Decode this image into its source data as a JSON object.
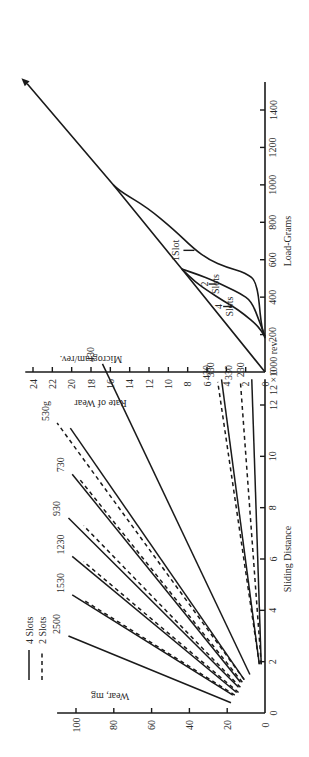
{
  "chart_data": [
    {
      "type": "line",
      "title": "",
      "xlabel": "Sliding Distance",
      "x_unit_label": "12 ×1000 rev.",
      "ylabel": "Wear, mg",
      "xlim": [
        0,
        13
      ],
      "ylim": [
        0,
        110
      ],
      "x_ticks": [
        0,
        2,
        4,
        6,
        8,
        10,
        12
      ],
      "y_ticks": [
        0,
        20,
        40,
        60,
        80,
        100
      ],
      "legend": {
        "placement": "top-left",
        "entries": [
          {
            "label": "4 Slots",
            "style": "solid"
          },
          {
            "label": "2 Slots",
            "style": "dashed"
          }
        ]
      },
      "series": [
        {
          "name": "2500",
          "group": "4 Slots",
          "style": "solid",
          "label": "2500",
          "points": [
            [
              0.4,
              18
            ],
            [
              3.0,
              104
            ]
          ]
        },
        {
          "name": "1530 (4 slots)",
          "group": "4 Slots",
          "style": "solid",
          "label": "1530",
          "points": [
            [
              0.7,
              17
            ],
            [
              4.6,
              102
            ]
          ]
        },
        {
          "name": "1530 (2 slots)",
          "group": "2 Slots",
          "style": "dashed",
          "label": "",
          "points": [
            [
              0.7,
              16
            ],
            [
              4.4,
              96
            ]
          ]
        },
        {
          "name": "1230 (4 slots)",
          "group": "4 Slots",
          "style": "solid",
          "label": "1230",
          "points": [
            [
              0.8,
              15
            ],
            [
              6.1,
              102
            ]
          ]
        },
        {
          "name": "1230 (2 slots)",
          "group": "2 Slots",
          "style": "dashed",
          "label": "",
          "points": [
            [
              0.8,
              14
            ],
            [
              5.9,
              96
            ]
          ]
        },
        {
          "name": "930 (4 slots)",
          "group": "4 Slots",
          "style": "solid",
          "label": "930",
          "points": [
            [
              1.0,
              14
            ],
            [
              7.6,
              104
            ]
          ]
        },
        {
          "name": "930 (2 slots)",
          "group": "2 Slots",
          "style": "dashed",
          "label": "",
          "points": [
            [
              1.0,
              13
            ],
            [
              7.3,
              96
            ]
          ]
        },
        {
          "name": "730 (4 slots)",
          "group": "4 Slots",
          "style": "solid",
          "label": "730",
          "points": [
            [
              1.2,
              13
            ],
            [
              9.3,
              102
            ]
          ]
        },
        {
          "name": "730 (2 slots)",
          "group": "2 Slots",
          "style": "dashed",
          "label": "",
          "points": [
            [
              1.2,
              12
            ],
            [
              9.1,
              98
            ]
          ]
        },
        {
          "name": "530g (2 slots)",
          "group": "2 Slots",
          "style": "dashed",
          "label": "530g",
          "points": [
            [
              1.3,
              11
            ],
            [
              11.3,
              110
            ]
          ]
        },
        {
          "name": "530 (4 slots)",
          "group": "4 Slots",
          "style": "solid",
          "label": "",
          "points": [
            [
              1.3,
              11
            ],
            [
              11.1,
              103
            ]
          ]
        },
        {
          "name": "430 (4 slots, upper)",
          "group": "4 Slots",
          "style": "solid",
          "label": "430",
          "points": [
            [
              1.5,
              8
            ],
            [
              13.6,
              86
            ]
          ]
        },
        {
          "name": "430 (2 slots)",
          "group": "2 Slots",
          "style": "dashed",
          "label": "430",
          "points": [
            [
              1.9,
              3
            ],
            [
              12.9,
              25
            ]
          ]
        },
        {
          "name": "330 (4 slots)",
          "group": "4 Slots",
          "style": "solid",
          "label": "330",
          "points": [
            [
              1.9,
              3
            ],
            [
              13.0,
              23
            ]
          ]
        },
        {
          "name": "330 (2 slots)",
          "group": "2 Slots",
          "style": "dashed",
          "label": "330",
          "points": [
            [
              1.9,
              2
            ],
            [
              12.9,
              13
            ]
          ]
        },
        {
          "name": "230 (4 slots)",
          "group": "4 Slots",
          "style": "solid",
          "label": "230",
          "points": [
            [
              1.9,
              2
            ],
            [
              13.0,
              7
            ]
          ]
        }
      ]
    },
    {
      "type": "line",
      "title": "",
      "xlabel": "Load-Grams",
      "ylabel": "Rate of Wear",
      "ylabel_unit": "Microgram/rev.",
      "xlim": [
        0,
        1550
      ],
      "ylim": [
        0,
        25
      ],
      "x_ticks": [
        0,
        200,
        400,
        600,
        800,
        1000,
        1200,
        1400
      ],
      "y_ticks": [
        0,
        2,
        4,
        6,
        8,
        10,
        12,
        14,
        16,
        18,
        20,
        22,
        24
      ],
      "arrow_at_end": true,
      "series": [
        {
          "name": "Reference line (no slots)",
          "label": "",
          "points": [
            [
              0,
              0
            ],
            [
              550,
              8.6
            ],
            [
              1000,
              15.7
            ],
            [
              1540,
              24.6
            ]
          ]
        },
        {
          "name": "1 Slot",
          "label": "1Slot",
          "points": [
            [
              180,
              0
            ],
            [
              250,
              0.4
            ],
            [
              480,
              0.8
            ],
            [
              530,
              2
            ],
            [
              560,
              4
            ],
            [
              600,
              5.8
            ],
            [
              660,
              7.4
            ],
            [
              760,
              9.4
            ],
            [
              880,
              12.2
            ],
            [
              960,
              14.8
            ],
            [
              1000,
              15.7
            ]
          ]
        },
        {
          "name": "2 Slots",
          "label": "2 Slots",
          "points": [
            [
              190,
              0
            ],
            [
              260,
              0.5
            ],
            [
              380,
              1.4
            ],
            [
              420,
              2.6
            ],
            [
              450,
              3.8
            ],
            [
              490,
              5.4
            ],
            [
              520,
              6.9
            ],
            [
              550,
              8.6
            ]
          ]
        },
        {
          "name": "4 Slots",
          "label": "4 Slots",
          "points": [
            [
              190,
              0
            ],
            [
              250,
              0.8
            ],
            [
              310,
              2.2
            ],
            [
              350,
              3.3
            ],
            [
              380,
              4.3
            ],
            [
              430,
              5.8
            ],
            [
              480,
              7.2
            ],
            [
              550,
              8.6
            ]
          ]
        }
      ]
    }
  ]
}
